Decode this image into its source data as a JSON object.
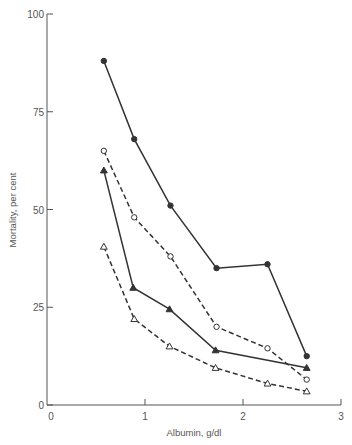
{
  "chart_data": {
    "type": "line",
    "title": "",
    "xlabel": "Albumin, g/dl",
    "ylabel": "Mortality, per cent",
    "xlim": [
      0,
      3
    ],
    "ylim": [
      0,
      100
    ],
    "xticks": [
      0,
      1,
      2,
      3
    ],
    "yticks": [
      0,
      25,
      50,
      75,
      100
    ],
    "grid": false,
    "legend": "none",
    "series": [
      {
        "name": "filled-circle-solid",
        "marker": "filled-circle",
        "line": "solid",
        "x": [
          0.58,
          0.89,
          1.26,
          1.73,
          2.25,
          2.65
        ],
        "y": [
          88,
          68,
          51,
          35,
          36,
          12.5
        ]
      },
      {
        "name": "open-circle-dashed",
        "marker": "open-circle",
        "line": "dashed",
        "x": [
          0.58,
          0.89,
          1.26,
          1.73,
          2.25,
          2.65
        ],
        "y": [
          65,
          48,
          38,
          20,
          14.5,
          6.5
        ]
      },
      {
        "name": "filled-triangle-solid",
        "marker": "filled-triangle",
        "line": "solid",
        "x": [
          0.58,
          0.88,
          1.25,
          1.72,
          2.65
        ],
        "y": [
          60,
          30,
          24.5,
          14,
          9.5
        ]
      },
      {
        "name": "open-triangle-dashed",
        "marker": "open-triangle",
        "line": "dashed",
        "x": [
          0.58,
          0.89,
          1.25,
          1.72,
          2.25,
          2.65
        ],
        "y": [
          40.5,
          22,
          15,
          9.5,
          5.5,
          3.5
        ]
      }
    ]
  },
  "colors": {
    "axis": "#555555",
    "line": "#333333"
  }
}
